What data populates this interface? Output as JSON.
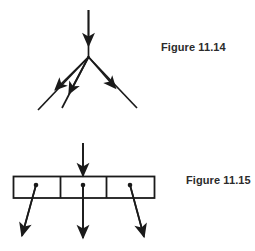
{
  "page": {
    "background_color": "#ffffff",
    "ink_color": "#1a1a1a",
    "text_color": "#2b2b2b",
    "width": 255,
    "height": 251
  },
  "figures": [
    {
      "id": "figure-11-14",
      "caption": "Figure 11.14",
      "kind": "node-with-three-outgoing-pointers",
      "description": "A single incoming arrow into a junction node that fans out into three outgoing arrows",
      "incoming_arrows": 1,
      "outgoing_arrows": 3
    },
    {
      "id": "figure-11-15",
      "caption": "Figure 11.15",
      "kind": "three-cell-record-with-pointers",
      "description": "An incoming arrow into a three-cell box, each cell holding a pointer dot with an outgoing arrow",
      "incoming_arrows": 1,
      "cells": 3,
      "outgoing_arrows": 3
    }
  ],
  "icons": {
    "arrowhead": "solid-triangle-arrowhead",
    "pointer_dot": "filled-circle-pointer"
  }
}
